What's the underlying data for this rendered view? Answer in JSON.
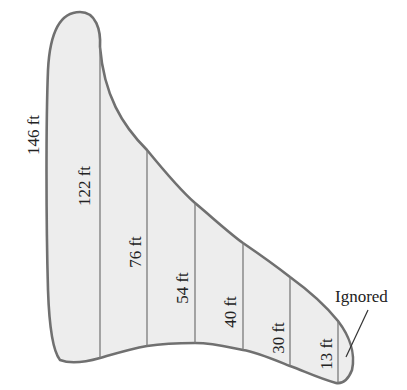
{
  "diagram": {
    "type": "irregular-region-cross-sections",
    "colors": {
      "fill": "#ededed",
      "outline": "#707070",
      "divider": "#7a7a7a",
      "text": "#222222",
      "background": "#ffffff"
    },
    "measurements": [
      {
        "label": "146 ft",
        "value": 146,
        "unit": "ft",
        "x": 35,
        "y": 135
      },
      {
        "label": "122 ft",
        "value": 122,
        "unit": "ft",
        "x": 86,
        "y": 186
      },
      {
        "label": "76 ft",
        "value": 76,
        "unit": "ft",
        "x": 137,
        "y": 252
      },
      {
        "label": "54 ft",
        "value": 54,
        "unit": "ft",
        "x": 184,
        "y": 288
      },
      {
        "label": "40 ft",
        "value": 40,
        "unit": "ft",
        "x": 232,
        "y": 312
      },
      {
        "label": "30 ft",
        "value": 30,
        "unit": "ft",
        "x": 280,
        "y": 338
      },
      {
        "label": "13 ft",
        "value": 13,
        "unit": "ft",
        "x": 328,
        "y": 354
      }
    ],
    "dividers": [
      {
        "x": 100,
        "y1": 47,
        "y2": 358
      },
      {
        "x": 147,
        "y1": 150,
        "y2": 346
      },
      {
        "x": 195,
        "y1": 203,
        "y2": 343
      },
      {
        "x": 243,
        "y1": 243,
        "y2": 350
      },
      {
        "x": 290,
        "y1": 277,
        "y2": 366
      },
      {
        "x": 338,
        "y1": 321,
        "y2": 383
      }
    ],
    "annotation": {
      "label": "Ignored",
      "x": 335,
      "y": 302,
      "leader": {
        "x1": 368,
        "y1": 310,
        "x2": 346,
        "y2": 357
      }
    }
  }
}
